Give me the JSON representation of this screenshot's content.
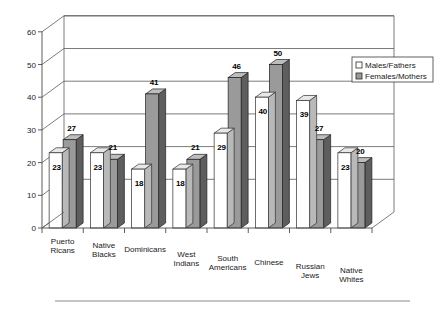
{
  "chart_data": {
    "type": "bar",
    "title": "",
    "subtitle": "",
    "xlabel": "",
    "ylabel": "",
    "ylim": [
      0,
      60
    ],
    "yticks": [
      0,
      10,
      20,
      30,
      40,
      50,
      60
    ],
    "ytick_labels": [
      "0",
      "10",
      "20",
      "30",
      "40",
      "50",
      "60"
    ],
    "grid": true,
    "grid_orientation": "horizontal",
    "style": "3d-grouped-column",
    "legend_position": "upper-right",
    "categories": [
      "Puerto Ricans",
      "Native Blacks",
      "Dominicans",
      "West Indians",
      "South Americans",
      "Chinese",
      "Russian Jews",
      "Native Whites"
    ],
    "category_lines": [
      [
        "Puerto",
        "Ricans"
      ],
      [
        "Native",
        "Blacks"
      ],
      [
        "Dominicans"
      ],
      [
        "West",
        "Indians"
      ],
      [
        "South",
        "Americans"
      ],
      [
        "Chinese"
      ],
      [
        "Russian",
        "Jews"
      ],
      [
        "Native",
        "Whites"
      ]
    ],
    "series": [
      {
        "name": "Males/Fathers",
        "color": "#ffffff",
        "values": [
          23,
          23,
          18,
          18,
          29,
          40,
          39,
          23
        ]
      },
      {
        "name": "Females/Mothers",
        "color": "#9a9a9a",
        "values": [
          27,
          21,
          41,
          21,
          46,
          50,
          27,
          20
        ]
      }
    ]
  },
  "legend": {
    "items": [
      {
        "label": "Males/Fathers",
        "swatch": "light"
      },
      {
        "label": "Females/Mothers",
        "swatch": "dark"
      }
    ]
  },
  "colors": {
    "series_light": "#ffffff",
    "series_dark": "#9a9a9a",
    "outline": "#2e2e2e",
    "grid": "#5a5a5a",
    "text": "#1a1a1a"
  }
}
